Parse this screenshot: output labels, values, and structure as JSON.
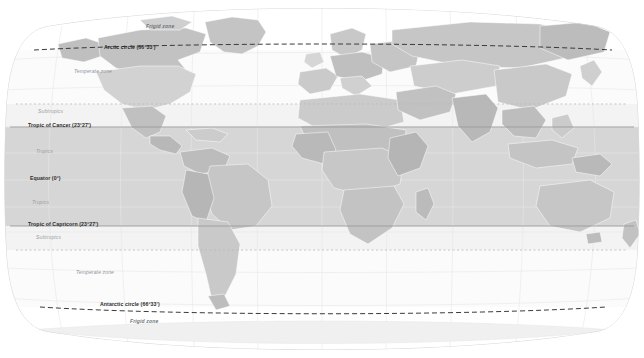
{
  "map": {
    "title": "World map of climate zones",
    "projection": "robinson",
    "background_color": "#ffffff",
    "ocean_color": "#fbfbfb",
    "graticule_color": "#ededed",
    "land_colors": [
      "#c9c9c9",
      "#d4d4d4",
      "#bdbdbd",
      "#dedede",
      "#b4b4b4",
      "#e3e3e3"
    ],
    "zone_band_colors": {
      "frigid": "#ffffff",
      "temperate": "#fafafa",
      "subtropics": "#f2f2f2",
      "tropics": "#c6c6c6"
    },
    "latitude_lines": [
      {
        "id": "arctic-circle",
        "label": "Arctic circle (66°33')",
        "y": 50,
        "x": 104,
        "style": "dashed"
      },
      {
        "id": "subtropic-north",
        "label": "",
        "y": 104,
        "x": 0,
        "style": "dotted"
      },
      {
        "id": "tropic-of-cancer",
        "label": "Tropic of Cancer (23°27')",
        "y": 127,
        "x": 28,
        "style": "solid"
      },
      {
        "id": "equator",
        "label": "Equator (0°)",
        "y": 180,
        "x": 30,
        "style": "none"
      },
      {
        "id": "tropic-of-capricorn",
        "label": "Tropic of Capricorn (23°27')",
        "y": 226,
        "x": 28,
        "style": "solid"
      },
      {
        "id": "subtropic-south",
        "label": "",
        "y": 250,
        "x": 0,
        "style": "dotted"
      },
      {
        "id": "antarctic-circle",
        "label": "Antarctic circle (66°33')",
        "y": 307,
        "x": 100,
        "style": "dashed"
      }
    ],
    "zone_labels": [
      {
        "id": "frigid-north",
        "label": "Frigid zone",
        "x": 146,
        "y": 28,
        "kind": "frigid"
      },
      {
        "id": "temperate-north",
        "label": "Temperate zone",
        "x": 74,
        "y": 72,
        "kind": "temperate"
      },
      {
        "id": "subtropics-north",
        "label": "Subtropics",
        "x": 38,
        "y": 112,
        "kind": "plain"
      },
      {
        "id": "tropics-north",
        "label": "Tropics",
        "x": 36,
        "y": 152,
        "kind": "plain"
      },
      {
        "id": "tropics-south",
        "label": "Tropics",
        "x": 32,
        "y": 203,
        "kind": "plain"
      },
      {
        "id": "subtropics-south",
        "label": "Subtropics",
        "x": 36,
        "y": 238,
        "kind": "plain"
      },
      {
        "id": "temperate-south",
        "label": "Temperate zone",
        "x": 76,
        "y": 273,
        "kind": "temperate"
      },
      {
        "id": "frigid-south",
        "label": "Frigid zone",
        "x": 130,
        "y": 322,
        "kind": "frigid"
      }
    ]
  }
}
